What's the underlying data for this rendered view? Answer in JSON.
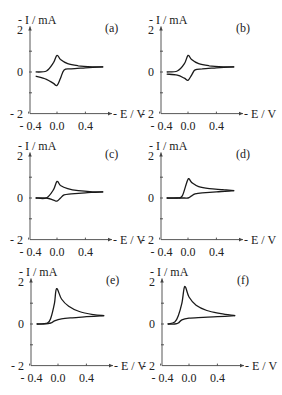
{
  "chart_data": [
    {
      "type": "line",
      "panel": "(a)",
      "xlabel": "E / V",
      "ylabel": "- I / mA",
      "xticks": [
        "- 0.4",
        "0.0",
        "0.4"
      ],
      "yticks": [
        "2",
        "0",
        "- 2"
      ],
      "xlim": [
        -0.4,
        0.8
      ],
      "ylim": [
        -2,
        2
      ],
      "series": [
        {
          "name": "forward",
          "x": [
            -0.3,
            -0.15,
            -0.05,
            0.0,
            0.05,
            0.15,
            0.3,
            0.5,
            0.65
          ],
          "y": [
            0.0,
            0.05,
            0.45,
            0.8,
            0.6,
            0.4,
            0.3,
            0.25,
            0.25
          ]
        },
        {
          "name": "reverse",
          "x": [
            0.65,
            0.4,
            0.2,
            0.1,
            0.05,
            0.0,
            -0.05,
            -0.15,
            -0.3
          ],
          "y": [
            0.25,
            0.2,
            0.15,
            0.1,
            -0.3,
            -0.65,
            -0.55,
            -0.35,
            -0.2
          ]
        }
      ]
    },
    {
      "type": "line",
      "panel": "(b)",
      "xlabel": "E / V",
      "ylabel": "- I / mA",
      "xticks": [
        "- 0.4",
        "0.0",
        "0.4"
      ],
      "yticks": [
        "2",
        "0",
        "- 2"
      ],
      "xlim": [
        -0.4,
        0.8
      ],
      "ylim": [
        -2,
        2
      ],
      "series": [
        {
          "name": "forward",
          "x": [
            -0.3,
            -0.15,
            -0.05,
            0.0,
            0.05,
            0.15,
            0.3,
            0.5,
            0.65
          ],
          "y": [
            0.0,
            0.05,
            0.4,
            0.8,
            0.6,
            0.4,
            0.3,
            0.25,
            0.25
          ]
        },
        {
          "name": "reverse",
          "x": [
            0.65,
            0.4,
            0.2,
            0.1,
            0.05,
            0.0,
            -0.05,
            -0.15,
            -0.3
          ],
          "y": [
            0.25,
            0.2,
            0.15,
            0.1,
            -0.15,
            -0.4,
            -0.3,
            -0.15,
            -0.1
          ]
        }
      ]
    },
    {
      "type": "line",
      "panel": "(c)",
      "xlabel": "E / V",
      "ylabel": "- I / mA",
      "xticks": [
        "- 0.4",
        "0.0",
        "0.4"
      ],
      "yticks": [
        "2",
        "0",
        "- 2"
      ],
      "xlim": [
        -0.4,
        0.8
      ],
      "ylim": [
        -2,
        2
      ],
      "series": [
        {
          "name": "forward",
          "x": [
            -0.3,
            -0.15,
            -0.05,
            0.0,
            0.05,
            0.15,
            0.3,
            0.5,
            0.65
          ],
          "y": [
            0.0,
            0.0,
            0.4,
            0.8,
            0.6,
            0.45,
            0.35,
            0.3,
            0.3
          ]
        },
        {
          "name": "reverse",
          "x": [
            0.65,
            0.4,
            0.2,
            0.1,
            0.05,
            0.0,
            -0.05,
            -0.15,
            -0.3
          ],
          "y": [
            0.3,
            0.25,
            0.2,
            0.15,
            0.0,
            -0.15,
            -0.1,
            0.0,
            0.0
          ]
        }
      ]
    },
    {
      "type": "line",
      "panel": "(d)",
      "xlabel": "E / V",
      "ylabel": "- I / mA",
      "xticks": [
        "- 0.4",
        "0.0",
        "0.4"
      ],
      "yticks": [
        "2",
        "0",
        "- 2"
      ],
      "xlim": [
        -0.4,
        0.8
      ],
      "ylim": [
        -2,
        2
      ],
      "series": [
        {
          "name": "forward",
          "x": [
            -0.3,
            -0.15,
            -0.08,
            0.0,
            0.05,
            0.15,
            0.3,
            0.5,
            0.65
          ],
          "y": [
            0.0,
            0.0,
            0.1,
            0.9,
            0.75,
            0.55,
            0.45,
            0.4,
            0.35
          ]
        },
        {
          "name": "reverse",
          "x": [
            0.65,
            0.4,
            0.2,
            0.1,
            0.05,
            0.0,
            -0.05,
            -0.15,
            -0.3
          ],
          "y": [
            0.35,
            0.3,
            0.25,
            0.2,
            0.1,
            0.0,
            0.0,
            0.0,
            0.0
          ]
        }
      ]
    },
    {
      "type": "line",
      "panel": "(e)",
      "xlabel": "E / V",
      "ylabel": "- I / mA",
      "xticks": [
        "- 0.4",
        "0.0",
        "0.4"
      ],
      "yticks": [
        "2",
        "0",
        "- 2"
      ],
      "xlim": [
        -0.4,
        0.8
      ],
      "ylim": [
        -2,
        2
      ],
      "series": [
        {
          "name": "forward",
          "x": [
            -0.3,
            -0.15,
            -0.1,
            -0.05,
            -0.02,
            0.05,
            0.15,
            0.3,
            0.5,
            0.65
          ],
          "y": [
            0.0,
            0.05,
            0.3,
            1.0,
            1.7,
            1.2,
            0.85,
            0.6,
            0.45,
            0.4
          ]
        },
        {
          "name": "reverse",
          "x": [
            0.65,
            0.4,
            0.2,
            0.05,
            -0.05,
            -0.1,
            -0.2,
            -0.3
          ],
          "y": [
            0.4,
            0.35,
            0.3,
            0.25,
            0.15,
            0.05,
            0.0,
            0.0
          ]
        }
      ]
    },
    {
      "type": "line",
      "panel": "(f)",
      "xlabel": "E / V",
      "ylabel": "- I / mA",
      "xticks": [
        "- 0.4",
        "0.0",
        "0.4"
      ],
      "yticks": [
        "2",
        "0",
        "- 2"
      ],
      "xlim": [
        -0.4,
        0.8
      ],
      "ylim": [
        -2,
        2
      ],
      "series": [
        {
          "name": "forward",
          "x": [
            -0.3,
            -0.2,
            -0.15,
            -0.1,
            -0.06,
            0.0,
            0.1,
            0.25,
            0.45,
            0.65
          ],
          "y": [
            0.0,
            0.1,
            0.4,
            1.0,
            1.8,
            1.3,
            0.9,
            0.65,
            0.5,
            0.4
          ]
        },
        {
          "name": "reverse",
          "x": [
            0.65,
            0.4,
            0.2,
            0.0,
            -0.1,
            -0.15,
            -0.2,
            -0.3
          ],
          "y": [
            0.4,
            0.35,
            0.32,
            0.28,
            0.2,
            0.05,
            0.0,
            0.0
          ]
        }
      ]
    }
  ],
  "panels": [
    {
      "id": "a",
      "tag": "(a)",
      "ylabel": "- I / mA",
      "xlabel": "- E / V",
      "y2": "2",
      "y0": "0",
      "ym2": "- 2",
      "xt1": "- 0.4",
      "xt2": "0.0",
      "xt3": "0.4"
    },
    {
      "id": "b",
      "tag": "(b)",
      "ylabel": "- I / mA",
      "xlabel": "- E / V",
      "y2": "2",
      "y0": "0",
      "ym2": "- 2",
      "xt1": "- 0.4",
      "xt2": "0.0",
      "xt3": "0.4"
    },
    {
      "id": "c",
      "tag": "(c)",
      "ylabel": "- I / mA",
      "xlabel": "- E / V",
      "y2": "2",
      "y0": "0",
      "ym2": "- 2",
      "xt1": "- 0.4",
      "xt2": "0.0",
      "xt3": "0.4"
    },
    {
      "id": "d",
      "tag": "(d)",
      "ylabel": "- I / mA",
      "xlabel": "- E / V",
      "y2": "2",
      "y0": "0",
      "ym2": "- 2",
      "xt1": "- 0.4",
      "xt2": "0.0",
      "xt3": "0.4"
    },
    {
      "id": "e",
      "tag": "(e)",
      "ylabel": "- I / mA",
      "xlabel": "- E / V",
      "y2": "2",
      "y0": "0",
      "ym2": "- 2",
      "xt1": "- 0.4",
      "xt2": "0.0",
      "xt3": "0.4"
    },
    {
      "id": "f",
      "tag": "(f)",
      "ylabel": "- I / mA",
      "xlabel": "- E / V",
      "y2": "2",
      "y0": "0",
      "ym2": "- 2",
      "xt1": "- 0.4",
      "xt2": "0.0",
      "xt3": "0.4"
    }
  ]
}
